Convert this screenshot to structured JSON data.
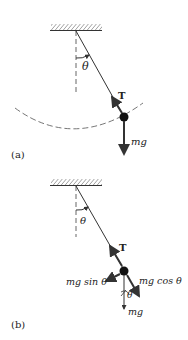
{
  "figure": {
    "panels": [
      {
        "id": "a",
        "label": "(a)",
        "angle_label": "θ",
        "tension_label": "T",
        "weight_label": "mg"
      },
      {
        "id": "b",
        "label": "(b)",
        "angle_label": "θ",
        "tension_label": "T",
        "tangential_label": "mg sin θ",
        "radial_label": "mg cos θ",
        "small_angle_label": "θ",
        "weight_label": "mg"
      }
    ],
    "colors": {
      "line": "#333333",
      "arrow": "#3a3a3a",
      "bob": "#111111",
      "dashed": "#666666"
    }
  }
}
